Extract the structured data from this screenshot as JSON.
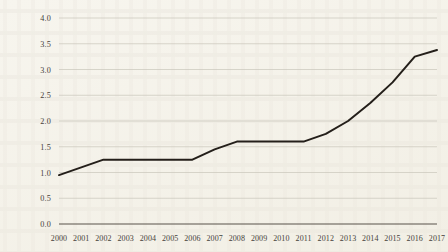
{
  "chart_data": {
    "type": "line",
    "title": "",
    "subtitle": "",
    "xlabel": "",
    "ylabel": "",
    "categories": [
      "2000",
      "2001",
      "2002",
      "2003",
      "2004",
      "2005",
      "2006",
      "2007",
      "2008",
      "2009",
      "2010",
      "2011",
      "2012",
      "2013",
      "2014",
      "2015",
      "2016",
      "2017"
    ],
    "x": [
      2000,
      2001,
      2002,
      2003,
      2004,
      2005,
      2006,
      2007,
      2008,
      2009,
      2010,
      2011,
      2012,
      2013,
      2014,
      2015,
      2016,
      2017
    ],
    "values": [
      0.95,
      1.1,
      1.25,
      1.25,
      1.25,
      1.25,
      1.25,
      1.45,
      1.6,
      1.6,
      1.6,
      1.6,
      1.75,
      2.0,
      2.35,
      2.75,
      3.25,
      3.38
    ],
    "series": [
      {
        "name": "series-1",
        "color": "#241f1a",
        "values": [
          0.95,
          1.1,
          1.25,
          1.25,
          1.25,
          1.25,
          1.25,
          1.45,
          1.6,
          1.6,
          1.6,
          1.6,
          1.75,
          2.0,
          2.35,
          2.75,
          3.25,
          3.38
        ]
      }
    ],
    "ylim": [
      0.0,
      4.0
    ],
    "yticks": [
      0.0,
      0.5,
      1.0,
      1.5,
      2.0,
      2.5,
      3.0,
      3.5,
      4.0
    ],
    "ytick_labels": [
      "0.0",
      "0.5",
      "1.0",
      "1.5",
      "2.0",
      "2.5",
      "3.0",
      "3.5",
      "4.0"
    ],
    "xlim": [
      2000,
      2017
    ],
    "grid": "horizontal",
    "legend": "none",
    "annotations": [],
    "colors": {
      "background": "#f7f5ee",
      "line": "#241f1a",
      "gridline": "#c9c6ba",
      "axis": "#58534a",
      "tick_text": "#46413a"
    }
  }
}
